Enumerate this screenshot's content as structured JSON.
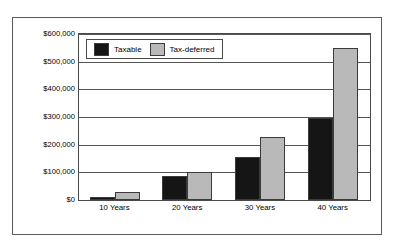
{
  "chart_data": {
    "type": "bar",
    "title": "",
    "xlabel": "",
    "ylabel": "",
    "categories": [
      "10 Years",
      "20 Years",
      "30 Years",
      "40 Years"
    ],
    "series": [
      {
        "name": "Taxable",
        "color": "#151515",
        "values": [
          12000,
          88000,
          155000,
          295000
        ]
      },
      {
        "name": "Tax-deferred",
        "color": "#b9b9b9",
        "values": [
          30000,
          100000,
          227000,
          550000
        ]
      }
    ],
    "ylim": [
      0,
      600000
    ],
    "ytick_values": [
      0,
      100000,
      200000,
      300000,
      400000,
      500000,
      600000
    ],
    "ytick_labels": [
      "$0",
      "$100,000",
      "$200,000",
      "$300,000",
      "$400,000",
      "$500,000",
      "$600,000"
    ],
    "grid": true,
    "grid_axis": "y",
    "legend_position": "upper-left-inside",
    "legend": [
      "Taxable",
      "Tax-deferred"
    ],
    "annotations": []
  },
  "legend": {
    "entries": [
      {
        "label": "Taxable"
      },
      {
        "label": "Tax-deferred"
      }
    ]
  }
}
